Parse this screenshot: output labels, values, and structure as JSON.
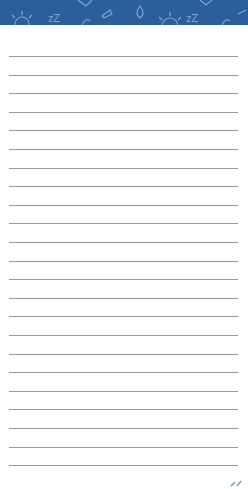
{
  "notepad": {
    "header": {
      "background_color": "#2a5f9a",
      "pattern_icons": [
        "gear-icon",
        "zz-sleep-icon",
        "leaf-icon",
        "plane-icon",
        "water-drop-icon",
        "gear-icon",
        "zz-sleep-icon",
        "leaf-icon",
        "plane-icon",
        "note-icon"
      ]
    },
    "ruled_lines": {
      "count": 23,
      "first_y": 56,
      "spacing": 18.6,
      "color": "#9a9a9a"
    }
  }
}
